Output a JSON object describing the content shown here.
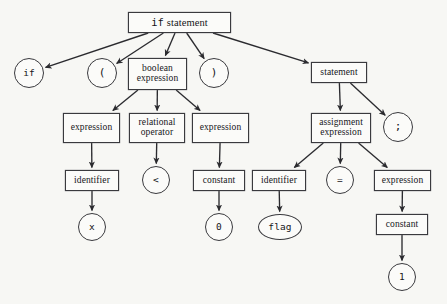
{
  "diagram": {
    "background_color": "#f7f7f4",
    "line_color": "#2b2b2f",
    "node_fill": "#fbfbf9",
    "nodes": [
      {
        "id": "root",
        "label": "if statement",
        "label_mono_prefix": "if",
        "label_serif_suffix": "statement",
        "shape": "rect",
        "x": 128,
        "y": 12,
        "w": 103,
        "h": 21,
        "font_size": 10.5
      },
      {
        "id": "if_tok",
        "label": "if",
        "shape": "circle",
        "x": 14,
        "y": 58,
        "w": 30,
        "h": 30,
        "font_size": 9.5,
        "font": "mono"
      },
      {
        "id": "lparen",
        "label": "(",
        "shape": "circle",
        "x": 87,
        "y": 58,
        "w": 30,
        "h": 30,
        "font_size": 11,
        "font": "mono"
      },
      {
        "id": "bool_expr",
        "label": "boolean\nexpression",
        "shape": "rect",
        "x": 128,
        "y": 58,
        "w": 59,
        "h": 32,
        "font_size": 9.5
      },
      {
        "id": "rparen",
        "label": ")",
        "shape": "circle",
        "x": 199,
        "y": 58,
        "w": 30,
        "h": 30,
        "font_size": 11,
        "font": "mono"
      },
      {
        "id": "statement",
        "label": "statement",
        "shape": "rect",
        "x": 311,
        "y": 62,
        "w": 56,
        "h": 21,
        "font_size": 9.5
      },
      {
        "id": "expr_l",
        "label": "expression",
        "shape": "rect",
        "x": 63,
        "y": 113,
        "w": 57,
        "h": 30,
        "font_size": 9.5
      },
      {
        "id": "rel_op",
        "label": "relational\noperator",
        "shape": "rect",
        "x": 129,
        "y": 113,
        "w": 56,
        "h": 30,
        "font_size": 9.5
      },
      {
        "id": "expr_r",
        "label": "expression",
        "shape": "rect",
        "x": 192,
        "y": 113,
        "w": 57,
        "h": 30,
        "font_size": 9.5
      },
      {
        "id": "assign_expr",
        "label": "assignment\nexpression",
        "shape": "rect",
        "x": 311,
        "y": 113,
        "w": 60,
        "h": 30,
        "font_size": 9.5
      },
      {
        "id": "semicolon",
        "label": ";",
        "shape": "circle",
        "x": 383,
        "y": 112,
        "w": 30,
        "h": 30,
        "font_size": 11,
        "font": "mono"
      },
      {
        "id": "ident_l",
        "label": "identifier",
        "shape": "rect",
        "x": 65,
        "y": 170,
        "w": 54,
        "h": 21,
        "font_size": 9.5
      },
      {
        "id": "lt_tok",
        "label": "<",
        "shape": "circle",
        "x": 142,
        "y": 166,
        "w": 28,
        "h": 28,
        "font_size": 9.5,
        "font": "mono"
      },
      {
        "id": "const_l",
        "label": "constant",
        "shape": "rect",
        "x": 193,
        "y": 170,
        "w": 52,
        "h": 21,
        "font_size": 9.5
      },
      {
        "id": "ident_r",
        "label": "identifier",
        "shape": "rect",
        "x": 252,
        "y": 170,
        "w": 54,
        "h": 21,
        "font_size": 9.5
      },
      {
        "id": "assign_tok",
        "label": "=",
        "shape": "circle",
        "x": 326,
        "y": 166,
        "w": 28,
        "h": 28,
        "font_size": 9.5,
        "font": "mono"
      },
      {
        "id": "expr_rr",
        "label": "expression",
        "shape": "rect",
        "x": 374,
        "y": 170,
        "w": 57,
        "h": 21,
        "font_size": 9.5
      },
      {
        "id": "x_tok",
        "label": "x",
        "shape": "circle",
        "x": 78,
        "y": 213,
        "w": 28,
        "h": 28,
        "font_size": 9.5,
        "font": "mono"
      },
      {
        "id": "zero_tok",
        "label": "0",
        "shape": "circle",
        "x": 205,
        "y": 213,
        "w": 28,
        "h": 28,
        "font_size": 9.5,
        "font": "mono"
      },
      {
        "id": "flag_tok",
        "label": "flag",
        "shape": "ellipse",
        "x": 258,
        "y": 214,
        "w": 44,
        "h": 26,
        "font_size": 9.5,
        "font": "mono"
      },
      {
        "id": "const_r",
        "label": "constant",
        "shape": "rect",
        "x": 376,
        "y": 214,
        "w": 52,
        "h": 21,
        "font_size": 9.5
      },
      {
        "id": "one_tok",
        "label": "1",
        "shape": "circle",
        "x": 388,
        "y": 263,
        "w": 28,
        "h": 28,
        "font_size": 9.5,
        "font": "mono"
      }
    ],
    "edges": [
      {
        "from": "root",
        "to": "if_tok"
      },
      {
        "from": "root",
        "to": "lparen"
      },
      {
        "from": "root",
        "to": "bool_expr"
      },
      {
        "from": "root",
        "to": "rparen"
      },
      {
        "from": "root",
        "to": "statement"
      },
      {
        "from": "bool_expr",
        "to": "expr_l"
      },
      {
        "from": "bool_expr",
        "to": "rel_op"
      },
      {
        "from": "bool_expr",
        "to": "expr_r"
      },
      {
        "from": "statement",
        "to": "assign_expr"
      },
      {
        "from": "statement",
        "to": "semicolon"
      },
      {
        "from": "expr_l",
        "to": "ident_l"
      },
      {
        "from": "rel_op",
        "to": "lt_tok"
      },
      {
        "from": "expr_r",
        "to": "const_l"
      },
      {
        "from": "assign_expr",
        "to": "ident_r"
      },
      {
        "from": "assign_expr",
        "to": "assign_tok"
      },
      {
        "from": "assign_expr",
        "to": "expr_rr"
      },
      {
        "from": "ident_l",
        "to": "x_tok"
      },
      {
        "from": "const_l",
        "to": "zero_tok"
      },
      {
        "from": "ident_r",
        "to": "flag_tok"
      },
      {
        "from": "expr_rr",
        "to": "const_r"
      },
      {
        "from": "const_r",
        "to": "one_tok"
      }
    ]
  }
}
